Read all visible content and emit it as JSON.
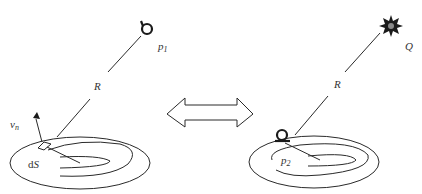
{
  "figure": {
    "left_panel": {
      "point_label": "p",
      "point_subscript": "1",
      "distance_label": "R",
      "normal_label": "v",
      "normal_subscript": "n",
      "area_label_prefix": "d",
      "area_label_var": "S",
      "point_icon": "receiver-icon"
    },
    "center": {
      "arrow_icon": "double-arrow-icon",
      "meaning": "equivalence / reciprocity"
    },
    "right_panel": {
      "source_label": "Q",
      "distance_label": "R",
      "point_label": "p",
      "point_subscript": "2",
      "source_icon": "star-burst-source-icon",
      "point_icon": "receiver-icon"
    }
  }
}
